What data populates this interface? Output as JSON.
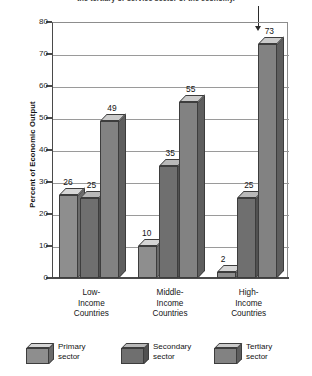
{
  "caption": {
    "text": "the tertiary or service sector of the economy.",
    "leader_note": "pointer-to-tertiary-bar"
  },
  "chart_data": {
    "type": "bar",
    "title": "",
    "subtitle": "",
    "xlabel": "",
    "ylabel": "Percent of Economic Output",
    "ylim": [
      0,
      80
    ],
    "yticks": [
      0,
      10,
      20,
      30,
      40,
      50,
      60,
      70,
      80
    ],
    "grid": true,
    "legend_position": "bottom",
    "style": "3d-bars",
    "categories": [
      "Low-\nIncome\nCountries",
      "Middle-\nIncome\nCountries",
      "High-\nIncome\nCountries"
    ],
    "category_labels": [
      {
        "line1": "Low-",
        "line2": "Income",
        "line3": "Countries"
      },
      {
        "line1": "Middle-",
        "line2": "Income",
        "line3": "Countries"
      },
      {
        "line1": "High-",
        "line2": "Income",
        "line3": "Countries"
      }
    ],
    "series": [
      {
        "name": "Primary sector",
        "legend_line1": "Primary",
        "legend_line2": "sector",
        "color": "#8e8e8e",
        "top_color": "#d6d6d6",
        "side_color": "#6b6b6b",
        "values": [
          26,
          10,
          2
        ]
      },
      {
        "name": "Secondary sector",
        "legend_line1": "Secondary",
        "legend_line2": "sector",
        "color": "#6f6f6f",
        "top_color": "#b9b9b9",
        "side_color": "#515151",
        "values": [
          25,
          35,
          25
        ]
      },
      {
        "name": "Tertiary sector",
        "legend_line1": "Tertiary",
        "legend_line2": "sector",
        "color": "#828282",
        "top_color": "#cbcbcb",
        "side_color": "#5e5e5e",
        "values": [
          49,
          55,
          73
        ]
      }
    ],
    "data_labels": [
      {
        "series": "Primary sector",
        "category": "Low-Income Countries",
        "value": 26
      },
      {
        "series": "Secondary sector",
        "category": "Low-Income Countries",
        "value": 25
      },
      {
        "series": "Tertiary sector",
        "category": "Low-Income Countries",
        "value": 49
      },
      {
        "series": "Primary sector",
        "category": "Middle-Income Countries",
        "value": 10
      },
      {
        "series": "Secondary sector",
        "category": "Middle-Income Countries",
        "value": 35
      },
      {
        "series": "Tertiary sector",
        "category": "Middle-Income Countries",
        "value": 55
      },
      {
        "series": "Primary sector",
        "category": "High-Income Countries",
        "value": 2
      },
      {
        "series": "Secondary sector",
        "category": "High-Income Countries",
        "value": 25
      },
      {
        "series": "Tertiary sector",
        "category": "High-Income Countries",
        "value": 73
      }
    ]
  },
  "axis": {
    "tick_0": "0",
    "tick_10": "10",
    "tick_20": "20",
    "tick_30": "30",
    "tick_40": "40",
    "tick_50": "50",
    "tick_60": "60",
    "tick_70": "70",
    "tick_80": "80"
  },
  "colors": {
    "axis": "#4a4a4a",
    "grid": "#9a9a9a",
    "text": "#141414",
    "background": "#ffffff"
  }
}
